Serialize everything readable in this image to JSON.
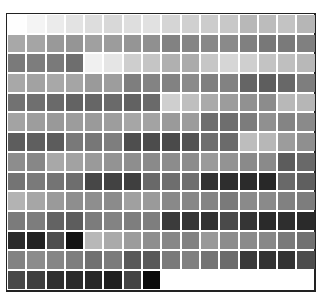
{
  "swatch_grid": {
    "columns": 16,
    "rows": 14,
    "frame_color": "#222222",
    "gap_color": "#ffffff",
    "cells": [
      [
        "#fefefe",
        "#f4f4f4",
        "#ebebeb",
        "#e3e3e3",
        "#dddddd",
        "#d8d8d8",
        "#dedede",
        "#e1e1e1",
        "#d5d5d5",
        "#d0d0d0",
        "#cccccc",
        "#c8c8c8",
        "#b8b8b8",
        "#bcbcbc",
        "#c3c3c3",
        "#b6b6b6"
      ],
      [
        "#a8a8a8",
        "#a5a5a5",
        "#999999",
        "#959595",
        "#a0a0a0",
        "#9c9c9c",
        "#959595",
        "#909090",
        "#828282",
        "#858585",
        "#888888",
        "#8a8a8a",
        "#808080",
        "#787878",
        "#7a7a7a",
        "#808080"
      ],
      [
        "#7a7a7a",
        "#7d7d7d",
        "#7a7a7a",
        "#6e6e6e",
        "#f0f0f0",
        "#e5e5e5",
        "#cecece",
        "#c5c5c5",
        "#b0b0b0",
        "#ababab",
        "#c6c6c6",
        "#d6d6d6",
        "#cfcfcf",
        "#c3c3c3",
        "#bfbfbf",
        "#b8b8b8"
      ],
      [
        "#a8a8a8",
        "#a2a2a2",
        "#a8a8a8",
        "#a5a5a5",
        "#9a9a9a",
        "#9d9d9d",
        "#7e7e7e",
        "#838383",
        "#828282",
        "#8a8a8a",
        "#7f7f7f",
        "#828282",
        "#656565",
        "#5e5e5e",
        "#686868",
        "#7e7e7e"
      ],
      [
        "#727272",
        "#6f6f6f",
        "#6a6a6a",
        "#636363",
        "#666666",
        "#6a6a6a",
        "#626262",
        "#6a6a6a",
        "#cfcfcf",
        "#bfbfbf",
        "#aaaaaa",
        "#9c9c9c",
        "#919191",
        "#8c8c8c",
        "#b8b8b8",
        "#b6b6b6"
      ],
      [
        "#a3a3a3",
        "#9d9d9d",
        "#999999",
        "#9c9c9c",
        "#9a9a9a",
        "#9d9d9d",
        "#a6a6a6",
        "#a3a3a3",
        "#9a9a9a",
        "#9c9c9c",
        "#6e6e6e",
        "#6e6e6e",
        "#7c7c7c",
        "#909090",
        "#848484",
        "#8a8a8a"
      ],
      [
        "#5d5d5d",
        "#5f5f5f",
        "#5c5c5c",
        "#797979",
        "#777777",
        "#7e7e7e",
        "#4e4e4e",
        "#4c4c4c",
        "#4a4a4a",
        "#535353",
        "#6e6e6e",
        "#6b6b6b",
        "#bdbdbd",
        "#b7b7b7",
        "#9c9c9c",
        "#8f8f8f"
      ],
      [
        "#8d8d8d",
        "#878787",
        "#a8a8a8",
        "#a2a2a2",
        "#9a9a9a",
        "#939393",
        "#8e8e8e",
        "#8a8a8a",
        "#8c8c8c",
        "#8c8c8c",
        "#9a9a9a",
        "#939393",
        "#8a8a8a",
        "#8a8a8a",
        "#5c5c5c",
        "#696969"
      ],
      [
        "#747474",
        "#7a7a7a",
        "#747474",
        "#6e6e6e",
        "#474747",
        "#424242",
        "#3f3f3f",
        "#696969",
        "#6e6e6e",
        "#6e6e6e",
        "#333333",
        "#2e2e2e",
        "#2b2b2b",
        "#282828",
        "#696969",
        "#5f5f5f"
      ],
      [
        "#b3b3b3",
        "#a6a6a6",
        "#9a9a9a",
        "#8e8e8e",
        "#8e8e8e",
        "#8b8b8b",
        "#a0a0a0",
        "#9a9a9a",
        "#898989",
        "#878787",
        "#848484",
        "#7a7a7a",
        "#8a8a8a",
        "#8a8a8a",
        "#818181",
        "#7d7d7d"
      ],
      [
        "#7b7b7b",
        "#7d7d7d",
        "#636363",
        "#5d5d5d",
        "#7c7c7c",
        "#838383",
        "#7e7e7e",
        "#7e7e7e",
        "#3b3b3b",
        "#353535",
        "#323232",
        "#4a4a4a",
        "#353535",
        "#2a2a2a",
        "#2e2e2e",
        "#2a2a2a"
      ],
      [
        "#2b2b2b",
        "#222222",
        "#4e4e4e",
        "#141414",
        "#b8b8b8",
        "#aaaaaa",
        "#9c9c9c",
        "#8e8e8e",
        "#878787",
        "#828282",
        "#999999",
        "#8c8c8c",
        "#8a8a8a",
        "#888888",
        "#7a7a7a",
        "#717171"
      ],
      [
        "#838383",
        "#8c8c8c",
        "#868686",
        "#7e7e7e",
        "#717171",
        "#7b7b7b",
        "#595959",
        "#595959",
        "#7a7a7a",
        "#808080",
        "#747474",
        "#6c6c6c",
        "#3a3a3a",
        "#333333",
        "#333333",
        "#4d4d4d"
      ],
      [
        "#484848",
        "#3f3f3f",
        "#2f2f2f",
        "#2b2b2b",
        "#282828",
        "#202020",
        "#444444",
        "#0a0a0a"
      ]
    ]
  }
}
